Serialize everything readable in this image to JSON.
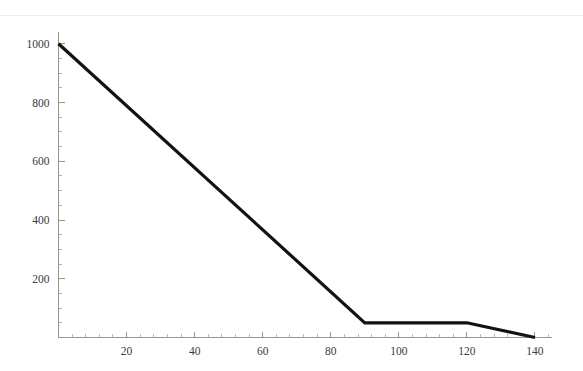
{
  "figure": {
    "background_color": "#ffffff",
    "top_rule_color": "#eceef2",
    "axis_color": "#8a8a8a",
    "line_color": "#121212"
  },
  "chart_data": {
    "type": "line",
    "title": "",
    "subtitle": "",
    "xlabel": "",
    "ylabel": "",
    "xlim": [
      0,
      145
    ],
    "ylim": [
      0,
      1040
    ],
    "grid": false,
    "legend": null,
    "x_ticks": [
      20,
      40,
      60,
      80,
      100,
      120,
      140
    ],
    "x_tick_labels": [
      "20",
      "40",
      "60",
      "80",
      "100",
      "120",
      "140"
    ],
    "x_minor_step": 4,
    "y_ticks": [
      200,
      400,
      600,
      800,
      1000
    ],
    "y_tick_labels": [
      "200",
      "400",
      "600",
      "800",
      "1000"
    ],
    "y_minor_step": 50,
    "series": [
      {
        "name": "",
        "x": [
          0,
          90,
          120,
          140
        ],
        "values": [
          1000,
          50,
          50,
          0
        ],
        "color": "#121212",
        "linewidth": 3.2,
        "points": [
          {
            "x": 0,
            "y": 1000
          },
          {
            "x": 90,
            "y": 50
          },
          {
            "x": 120,
            "y": 50
          },
          {
            "x": 140,
            "y": 0
          }
        ]
      }
    ],
    "annotations": []
  }
}
